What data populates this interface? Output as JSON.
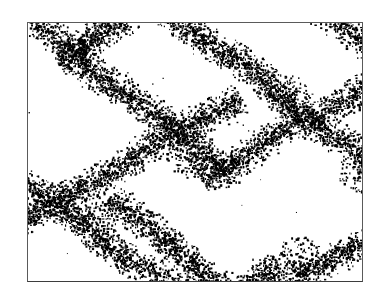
{
  "figure": {
    "panel_label": "a",
    "type": "micrograph-dot-map"
  },
  "frame": {
    "x": 27,
    "y": 22,
    "width": 336,
    "height": 260,
    "border_color": "#5a5a5a",
    "background_color": "#ffffff"
  },
  "scale_bar": {
    "x": 52,
    "y": 288,
    "width": 311,
    "color": "#2e2e2e",
    "thickness": 2
  },
  "colors": {
    "dot": "#000000",
    "background": "#ffffff",
    "frame": "#5a5a5a",
    "label": "#101010",
    "rule": "#2e2e2e"
  },
  "chart_data": {
    "type": "scatter",
    "title": "",
    "xlabel": "",
    "ylabel": "",
    "xlim": [
      0,
      336
    ],
    "ylim": [
      0,
      260
    ],
    "grid": false,
    "legend": null,
    "annotations": [
      "a"
    ],
    "rng_seed": 20240517,
    "dot_color": "#000000",
    "dot_size_range": [
      1,
      2.6
    ],
    "background_dot_count": 34,
    "band_sets": [
      {
        "name": "band-family-nw-se",
        "angle_deg": 36,
        "half_width": 13,
        "density_per_unit_length": 5.6,
        "lines": [
          {
            "id": "A1",
            "x0": -40,
            "y0": -30,
            "x1": 200,
            "y1": 145
          },
          {
            "id": "A2",
            "x0": 95,
            "y0": -40,
            "x1": 360,
            "y1": 150
          },
          {
            "id": "A3",
            "x0": 230,
            "y0": -55,
            "x1": 400,
            "y1": 70
          },
          {
            "id": "A4",
            "x0": -60,
            "y0": 120,
            "x1": 185,
            "y1": 300
          },
          {
            "id": "A5",
            "x0": 80,
            "y0": 175,
            "x1": 345,
            "y1": 370
          }
        ]
      },
      {
        "name": "band-family-sw-ne",
        "angle_deg": -31,
        "half_width": 13,
        "density_per_unit_length": 5.6,
        "lines": [
          {
            "id": "B1",
            "x0": -50,
            "y0": 230,
            "x1": 210,
            "y1": 70
          },
          {
            "id": "B2",
            "x0": -45,
            "y0": 420,
            "x1": 250,
            "y1": 240
          },
          {
            "id": "B3",
            "x0": 150,
            "y0": 330,
            "x1": 420,
            "y1": 165
          },
          {
            "id": "B4",
            "x0": 175,
            "y0": 160,
            "x1": 400,
            "y1": 20
          },
          {
            "id": "B5",
            "x0": 30,
            "y0": 40,
            "x1": 130,
            "y1": -25
          }
        ]
      }
    ],
    "junction_hotspots": [
      {
        "x": 163,
        "y": 130,
        "radius": 26,
        "extra_dots": 150
      },
      {
        "x": 68,
        "y": 192,
        "radius": 22,
        "extra_dots": 110
      },
      {
        "x": 262,
        "y": 73,
        "radius": 22,
        "extra_dots": 110
      },
      {
        "x": 272,
        "y": 232,
        "radius": 22,
        "extra_dots": 100
      },
      {
        "x": 46,
        "y": 33,
        "radius": 18,
        "extra_dots": 70
      },
      {
        "x": 330,
        "y": 150,
        "radius": 20,
        "extra_dots": 90
      }
    ]
  }
}
